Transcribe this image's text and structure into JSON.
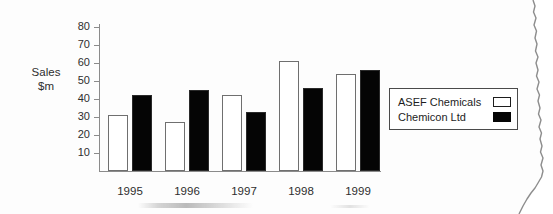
{
  "chart_data": {
    "type": "bar",
    "title": "",
    "subtitle": "",
    "xlabel": "",
    "ylabel": "Sales\n$m",
    "ylabel_line1": "Sales",
    "ylabel_line2": "$m",
    "categories": [
      "1995",
      "1996",
      "1997",
      "1998",
      "1999"
    ],
    "series": [
      {
        "name": "ASEF Chemicals",
        "swatch": "hollow",
        "color": "#ffffff",
        "values": [
          31,
          27,
          42,
          61,
          54
        ]
      },
      {
        "name": "Chemicon Ltd",
        "swatch": "filled",
        "color": "#050505",
        "values": [
          42,
          45,
          33,
          46,
          56
        ]
      }
    ],
    "ylim": [
      0,
      85
    ],
    "ytick_values": [
      80,
      70,
      60,
      50,
      40,
      30,
      20,
      10
    ],
    "ytick_labels": [
      "80",
      "70",
      "60",
      "50",
      "40",
      "30",
      "20",
      "10"
    ],
    "grid": false,
    "legend_position": "right",
    "axis_color": "#8b8b8b",
    "text_color": "#2e2e2e"
  },
  "legend": {
    "entries": [
      {
        "label": "ASEF Chemicals",
        "swatch": "hollow"
      },
      {
        "label": "Chemicon Ltd",
        "swatch": "filled"
      }
    ]
  }
}
